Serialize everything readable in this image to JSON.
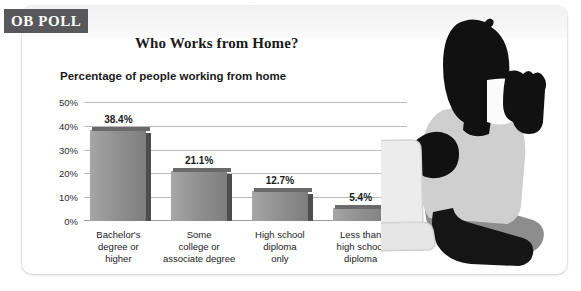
{
  "badge": {
    "label": "OB POLL",
    "bg_color": "#58585a",
    "text_color": "#ffffff"
  },
  "header": {
    "title": "Who Works from Home?",
    "subtitle": "Percentage of people working from home"
  },
  "illustration": {
    "name": "person-with-laptop-silhouette",
    "alt": "Silhouette of a person sitting cross-legged holding a mug next to a laptop"
  },
  "chart_data": {
    "type": "bar",
    "title": "Who Works from Home?",
    "subtitle": "Percentage of people working from home",
    "xlabel": "",
    "ylabel": "",
    "ylim": [
      0,
      50
    ],
    "grid": true,
    "legend": "none",
    "categories": [
      "Bachelor's degree or higher",
      "Some college or associate degree",
      "High school diploma only",
      "Less than high school diploma"
    ],
    "values": [
      38.4,
      21.1,
      12.7,
      5.4
    ],
    "value_labels": [
      "38.4%",
      "21.1%",
      "12.7%",
      "5.4%"
    ],
    "ytick_labels": [
      "50%",
      "40%",
      "30%",
      "20%",
      "10%",
      "0%"
    ],
    "ytick_values": [
      50,
      40,
      30,
      20,
      10,
      0
    ],
    "bar_color": "#8e8e8e",
    "bars": [
      {
        "label": "Bachelor's degree or higher",
        "value": 38.4,
        "value_label": "38.4%",
        "line1": "Bachelor's",
        "line2": "degree or",
        "line3": "higher"
      },
      {
        "label": "Some college or associate degree",
        "value": 21.1,
        "value_label": "21.1%",
        "line1": "Some",
        "line2": "college or",
        "line3": "associate degree"
      },
      {
        "label": "High school diploma only",
        "value": 12.7,
        "value_label": "12.7%",
        "line1": "High school",
        "line2": "diploma",
        "line3": "only"
      },
      {
        "label": "Less than high school diploma",
        "value": 5.4,
        "value_label": "5.4%",
        "line1": "Less than",
        "line2": "high school",
        "line3": "diploma"
      }
    ]
  }
}
